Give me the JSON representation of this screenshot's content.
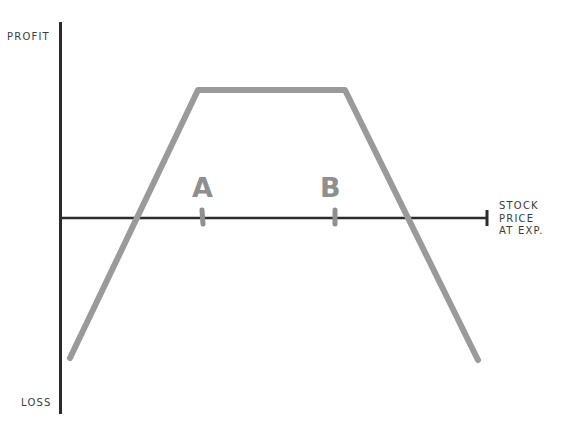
{
  "diagram": {
    "type": "option-payoff",
    "y_axis": {
      "top_label": "PROFIT",
      "bottom_label": "LOSS"
    },
    "x_axis": {
      "label_lines": [
        "STOCK",
        "PRICE",
        "AT EXP."
      ]
    },
    "markers": [
      {
        "id": "A",
        "label": "A"
      },
      {
        "id": "B",
        "label": "B"
      }
    ],
    "payoff_shape": "trapezoid (flat max profit between A and B, losses beyond)",
    "colors": {
      "axis": "#2b2b2b",
      "payoff_line": "#9a9a9a",
      "text": "#3a3a3a",
      "markers": "#8f8f8f"
    }
  }
}
